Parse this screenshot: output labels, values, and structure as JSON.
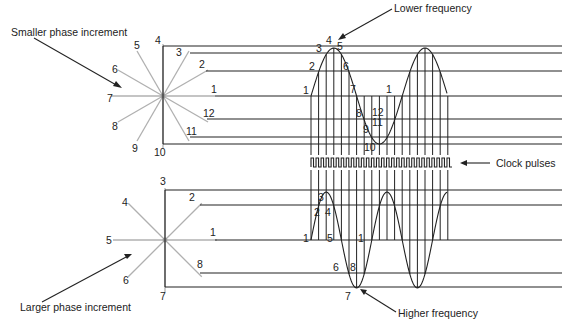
{
  "labels": {
    "smaller_phase": "Smaller phase increment",
    "larger_phase": "Larger phase increment",
    "lower_frequency": "Lower frequency",
    "higher_frequency": "Higher frequency",
    "clock_pulses": "Clock pulses"
  },
  "colors": {
    "spoke": "#b0b0b0",
    "line": "#222222",
    "center_dot": "#999999"
  },
  "top_phasor": {
    "center": [
      163,
      96
    ],
    "points": [
      {
        "n": "1",
        "angle": 0
      },
      {
        "n": "2",
        "angle": 30
      },
      {
        "n": "3",
        "angle": 60
      },
      {
        "n": "4",
        "angle": 90
      },
      {
        "n": "5",
        "angle": 120
      },
      {
        "n": "6",
        "angle": 150
      },
      {
        "n": "7",
        "angle": 180
      },
      {
        "n": "8",
        "angle": 210
      },
      {
        "n": "9",
        "angle": 240
      },
      {
        "n": "10",
        "angle": 270
      },
      {
        "n": "11",
        "angle": 300
      },
      {
        "n": "12",
        "angle": 330
      }
    ],
    "levels": [
      {
        "n": "4",
        "y": 46,
        "x_start": 163,
        "label": [
          155,
          44
        ]
      },
      {
        "n": "3",
        "y": 53,
        "x_start": 190,
        "label": [
          176,
          56
        ]
      },
      {
        "n": "2",
        "y": 71,
        "x_start": 206,
        "label": [
          199,
          68
        ]
      },
      {
        "n": "1",
        "y": 96,
        "x_start": 215,
        "label": [
          211,
          93
        ]
      },
      {
        "n": "12",
        "y": 119,
        "x_start": 207,
        "label": [
          203,
          117
        ]
      },
      {
        "n": "11",
        "y": 137,
        "x_start": 190,
        "label": [
          186,
          135
        ]
      },
      {
        "n": "10",
        "y": 144,
        "x_start": 163,
        "label": [
          154,
          156
        ]
      }
    ],
    "spoke_labels": [
      {
        "n": "5",
        "pos": [
          134,
          49
        ]
      },
      {
        "n": "6",
        "pos": [
          112,
          73
        ]
      },
      {
        "n": "7",
        "pos": [
          107,
          102
        ]
      },
      {
        "n": "8",
        "pos": [
          112,
          130
        ]
      },
      {
        "n": "9",
        "pos": [
          132,
          152
        ]
      }
    ]
  },
  "bottom_phasor": {
    "center": [
      165,
      240
    ],
    "points": [
      {
        "n": "1",
        "angle": 0
      },
      {
        "n": "2",
        "angle": 45
      },
      {
        "n": "3",
        "angle": 90
      },
      {
        "n": "4",
        "angle": 135
      },
      {
        "n": "5",
        "angle": 180
      },
      {
        "n": "6",
        "angle": 225
      },
      {
        "n": "7",
        "angle": 270
      },
      {
        "n": "8",
        "angle": 315
      }
    ],
    "levels": [
      {
        "n": "3",
        "y": 190,
        "x_start": 165,
        "label": [
          160,
          185
        ]
      },
      {
        "n": "2",
        "y": 205,
        "x_start": 200,
        "label": [
          189,
          201
        ]
      },
      {
        "n": "1",
        "y": 240,
        "x_start": 215,
        "label": [
          210,
          236
        ]
      },
      {
        "n": "8",
        "y": 273,
        "x_start": 200,
        "label": [
          197,
          268
        ]
      },
      {
        "n": "7",
        "y": 287,
        "x_start": 165,
        "label": [
          160,
          300
        ]
      }
    ],
    "spoke_labels": [
      {
        "n": "4",
        "pos": [
          122,
          206
        ]
      },
      {
        "n": "5",
        "pos": [
          106,
          244
        ]
      },
      {
        "n": "6",
        "pos": [
          123,
          284
        ]
      }
    ]
  },
  "top_wave": {
    "x_start": 311,
    "step": 7.6,
    "count": 19,
    "vline_bottom": 155,
    "samples": [
      "1",
      "2",
      "3",
      "4",
      "5",
      "6",
      "7",
      "8",
      "9",
      "10",
      "11",
      "12",
      "1"
    ],
    "sample_labels": [
      {
        "n": "1",
        "pos": [
          303,
          94
        ]
      },
      {
        "n": "2",
        "pos": [
          309,
          70
        ]
      },
      {
        "n": "3",
        "pos": [
          316,
          52
        ]
      },
      {
        "n": "4",
        "pos": [
          326,
          44
        ]
      },
      {
        "n": "5",
        "pos": [
          337,
          50
        ]
      },
      {
        "n": "6",
        "pos": [
          343,
          70
        ]
      },
      {
        "n": "7",
        "pos": [
          350,
          93
        ]
      },
      {
        "n": "8",
        "pos": [
          356,
          117
        ]
      },
      {
        "n": "9",
        "pos": [
          363,
          133
        ]
      },
      {
        "n": "10",
        "pos": [
          364,
          151
        ]
      },
      {
        "n": "11",
        "pos": [
          372,
          126
        ]
      },
      {
        "n": "12",
        "pos": [
          372,
          116
        ]
      },
      {
        "n": "1",
        "pos": [
          386,
          93
        ]
      }
    ]
  },
  "clock": {
    "x_start": 311,
    "x_end": 452,
    "y_top": 158,
    "y_bottom": 167,
    "pulses": 28
  },
  "bottom_wave": {
    "x_start": 311,
    "step": 7.6,
    "count": 19,
    "vline_top": 170,
    "sample_labels": [
      {
        "n": "1",
        "pos": [
          303,
          242
        ]
      },
      {
        "n": "2",
        "pos": [
          314,
          216
        ]
      },
      {
        "n": "3",
        "pos": [
          318,
          201
        ]
      },
      {
        "n": "4",
        "pos": [
          325,
          216
        ]
      },
      {
        "n": "5",
        "pos": [
          327,
          242
        ]
      },
      {
        "n": "6",
        "pos": [
          333,
          271
        ]
      },
      {
        "n": "7",
        "pos": [
          345,
          300
        ]
      },
      {
        "n": "8",
        "pos": [
          350,
          271
        ]
      },
      {
        "n": "1",
        "pos": [
          358,
          242
        ]
      }
    ]
  }
}
